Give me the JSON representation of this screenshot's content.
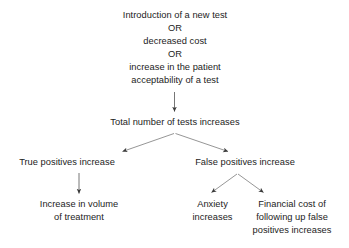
{
  "diagram": {
    "stroke_color": "#555555",
    "text_color": "#1c1c1c",
    "background_color": "#ffffff",
    "nodes": {
      "source": "Introduction of a new test\nOR\ndecreased cost\nOR\nincrease in the patient\nacceptability of a test",
      "total_tests": "Total number of tests increases",
      "true_positives": "True positives increase",
      "false_positives": "False positives increase",
      "volume_of_treatment": "Increase in volume\nof treatment",
      "anxiety": "Anxiety\nincreases",
      "financial_cost": "Financial cost of\nfollowing up false\npositives increases"
    },
    "edges": [
      {
        "name": "source-to-total",
        "from": "source",
        "to": "total_tests",
        "style": "straight-down-arrow"
      },
      {
        "name": "total-to-true-positives",
        "from": "total_tests",
        "to": "true_positives",
        "style": "diagonal-down-left-arrow"
      },
      {
        "name": "total-to-false-positives",
        "from": "total_tests",
        "to": "false_positives",
        "style": "diagonal-down-right-arrow"
      },
      {
        "name": "true-positives-to-volume",
        "from": "true_positives",
        "to": "volume_of_treatment",
        "style": "straight-down-arrow"
      },
      {
        "name": "false-positives-to-anxiety",
        "from": "false_positives",
        "to": "anxiety",
        "style": "diagonal-down-left-arrow"
      },
      {
        "name": "false-positives-to-financial-cost",
        "from": "false_positives",
        "to": "financial_cost",
        "style": "diagonal-down-right-arrow"
      }
    ]
  }
}
